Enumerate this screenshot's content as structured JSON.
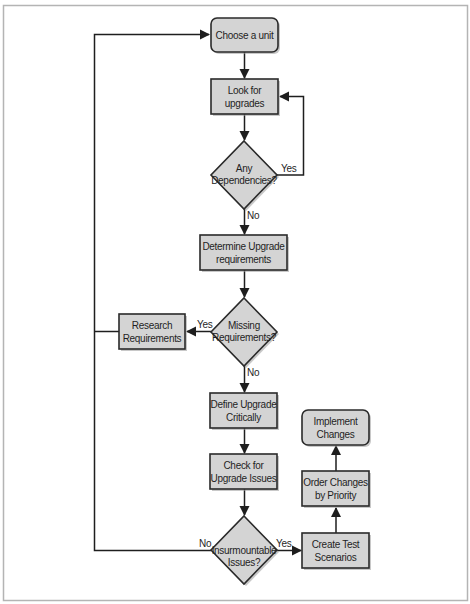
{
  "diagram": {
    "type": "flowchart",
    "nodes": {
      "choose_unit": {
        "shape": "rounded-rect",
        "lines": [
          "Choose a unit"
        ]
      },
      "look_upgrades": {
        "shape": "rect",
        "lines": [
          "Look for",
          "upgrades"
        ]
      },
      "any_dependencies": {
        "shape": "diamond",
        "lines": [
          "Any",
          "Dependencies?"
        ]
      },
      "determine_requirements": {
        "shape": "rect",
        "lines": [
          "Determine Upgrade",
          "requirements"
        ]
      },
      "missing_requirements": {
        "shape": "diamond",
        "lines": [
          "Missing",
          "Requirements?"
        ]
      },
      "research_requirements": {
        "shape": "rect",
        "lines": [
          "Research",
          "Requirements"
        ]
      },
      "define_upgrade": {
        "shape": "rect",
        "lines": [
          "Define Upgrade",
          "Critically"
        ]
      },
      "check_issues": {
        "shape": "rect",
        "lines": [
          "Check for",
          "Upgrade Issues"
        ]
      },
      "insurmountable_issues": {
        "shape": "diamond",
        "lines": [
          "Insurmountable",
          "Issues?"
        ]
      },
      "create_test": {
        "shape": "rect",
        "lines": [
          "Create Test",
          "Scenarios"
        ]
      },
      "order_changes": {
        "shape": "rect",
        "lines": [
          "Order Changes",
          "by Priority"
        ]
      },
      "implement_changes": {
        "shape": "rounded-rect",
        "lines": [
          "Implement",
          "Changes"
        ]
      }
    },
    "edge_labels": {
      "dep_yes": "Yes",
      "dep_no": "No",
      "missing_yes": "Yes",
      "missing_no": "No",
      "issues_no": "No",
      "issues_yes": "Yes"
    },
    "edges": [
      {
        "from": "choose_unit",
        "to": "look_upgrades"
      },
      {
        "from": "look_upgrades",
        "to": "any_dependencies"
      },
      {
        "from": "any_dependencies",
        "to": "look_upgrades",
        "label": "Yes"
      },
      {
        "from": "any_dependencies",
        "to": "determine_requirements",
        "label": "No"
      },
      {
        "from": "determine_requirements",
        "to": "missing_requirements"
      },
      {
        "from": "missing_requirements",
        "to": "research_requirements",
        "label": "Yes"
      },
      {
        "from": "research_requirements",
        "to": "choose_unit"
      },
      {
        "from": "missing_requirements",
        "to": "define_upgrade",
        "label": "No"
      },
      {
        "from": "define_upgrade",
        "to": "check_issues"
      },
      {
        "from": "check_issues",
        "to": "insurmountable_issues"
      },
      {
        "from": "insurmountable_issues",
        "to": "choose_unit",
        "label": "No"
      },
      {
        "from": "insurmountable_issues",
        "to": "create_test",
        "label": "Yes"
      },
      {
        "from": "create_test",
        "to": "order_changes"
      },
      {
        "from": "order_changes",
        "to": "implement_changes"
      }
    ],
    "colors": {
      "node_fill": "#d4d4d4",
      "node_stroke": "#2a2a2a",
      "line": "#1e1e1e",
      "frame": "#b4b4b4",
      "background": "#ffffff"
    }
  }
}
